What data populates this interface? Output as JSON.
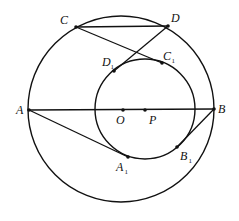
{
  "diagram": {
    "stroke_color": "#111111",
    "background": "#ffffff",
    "circles": [
      {
        "name": "outer-circle",
        "cx": 121,
        "cy": 109,
        "r": 93
      },
      {
        "name": "inner-circle",
        "cx": 145,
        "cy": 109,
        "r": 50
      }
    ],
    "points": [
      {
        "id": "C",
        "label": "C",
        "sub": "",
        "x": 76,
        "y": 27,
        "lx": 60,
        "ly": 24
      },
      {
        "id": "D",
        "label": "D",
        "sub": "",
        "x": 168,
        "y": 26,
        "lx": 171,
        "ly": 22
      },
      {
        "id": "D1",
        "label": "D",
        "sub": "1",
        "x": 114,
        "y": 71,
        "lx": 102,
        "ly": 66
      },
      {
        "id": "C1",
        "label": "C",
        "sub": "1",
        "x": 162,
        "y": 63,
        "lx": 163,
        "ly": 60
      },
      {
        "id": "A",
        "label": "A",
        "sub": "",
        "x": 29,
        "y": 110,
        "lx": 16,
        "ly": 114
      },
      {
        "id": "B",
        "label": "B",
        "sub": "",
        "x": 214,
        "y": 109,
        "lx": 218,
        "ly": 113
      },
      {
        "id": "O",
        "label": "O",
        "sub": "",
        "x": 123,
        "y": 110,
        "lx": 116,
        "ly": 124
      },
      {
        "id": "P",
        "label": "P",
        "sub": "",
        "x": 145,
        "y": 110,
        "lx": 149,
        "ly": 124
      },
      {
        "id": "A1",
        "label": "A",
        "sub": "1",
        "x": 128,
        "y": 157,
        "lx": 116,
        "ly": 171
      },
      {
        "id": "B1",
        "label": "B",
        "sub": "1",
        "x": 177,
        "y": 147,
        "lx": 180,
        "ly": 160
      }
    ],
    "segments": [
      {
        "name": "segment-CD",
        "from": "C",
        "to": "D"
      },
      {
        "name": "segment-CC1",
        "from": "C",
        "to": "C1"
      },
      {
        "name": "segment-DD1",
        "from": "D",
        "to": "D1"
      },
      {
        "name": "segment-AB",
        "from": "A",
        "to": "B"
      },
      {
        "name": "segment-AA1",
        "from": "A",
        "to": "A1"
      },
      {
        "name": "segment-BB1",
        "from": "B",
        "to": "B1"
      }
    ]
  }
}
